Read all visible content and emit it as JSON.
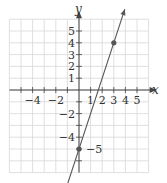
{
  "chart_data": {
    "type": "line",
    "title": "",
    "xlabel": "x",
    "ylabel": "y",
    "xlim": [
      -6,
      6
    ],
    "ylim": [
      -7,
      6
    ],
    "grid": true,
    "x_tick_labels": [
      "-4",
      "-2",
      "1",
      "2",
      "3",
      "4",
      "5"
    ],
    "y_tick_labels": [
      "5",
      "4",
      "3",
      "2",
      "1",
      "-2",
      "-4",
      "-5"
    ],
    "series": [
      {
        "name": "y = 3x - 5",
        "slope": 3,
        "intercept": -5,
        "points": [
          {
            "x": 0,
            "y": -5
          },
          {
            "x": 3,
            "y": 4
          }
        ],
        "arrows": "both"
      }
    ]
  },
  "labels": {
    "x_axis": "x",
    "y_axis": "y",
    "x_ticks": [
      {
        "v": -4,
        "t": "−4"
      },
      {
        "v": -2,
        "t": "−2"
      },
      {
        "v": 1,
        "t": "1"
      },
      {
        "v": 2,
        "t": "2"
      },
      {
        "v": 3,
        "t": "3"
      },
      {
        "v": 4,
        "t": "4"
      },
      {
        "v": 5,
        "t": "5"
      }
    ],
    "y_ticks": [
      {
        "v": 5,
        "t": "5"
      },
      {
        "v": 4,
        "t": "4"
      },
      {
        "v": 3,
        "t": "3"
      },
      {
        "v": 2,
        "t": "2"
      },
      {
        "v": 1,
        "t": "1"
      },
      {
        "v": -2,
        "t": "−2"
      },
      {
        "v": -4,
        "t": "−4"
      }
    ],
    "point_label": "−5"
  },
  "colors": {
    "grid": "#d8d8d8",
    "axis": "#444444",
    "line": "#555555",
    "point": "#555555"
  }
}
